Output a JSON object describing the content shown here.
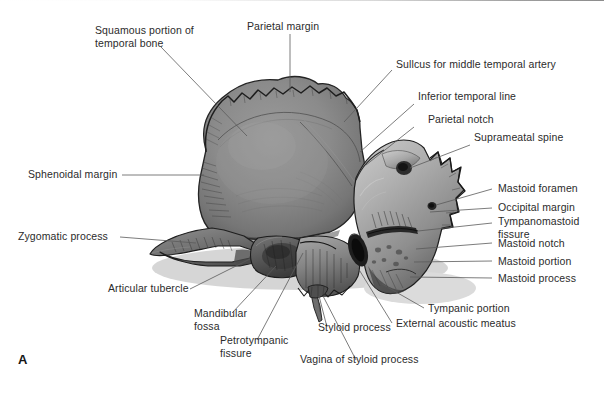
{
  "figure": {
    "panel_letter": "A",
    "background_color": "#ffffff",
    "leader_line_color": "#5a5a5a",
    "label_text_color": "#2b2b2b",
    "bone_tone_light": "#b8b8b8",
    "bone_tone_mid": "#8a8a8a",
    "bone_tone_dark": "#5c5c5c",
    "bone_outline": "#2a2a2a"
  },
  "labels": [
    {
      "id": "squamous-portion",
      "line1": "Squamous portion of",
      "line2": "temporal bone"
    },
    {
      "id": "parietal-margin",
      "line1": "Parietal margin",
      "line2": ""
    },
    {
      "id": "sulcus-middle-temporal-artery",
      "line1": "Sullcus for middle temporal artery",
      "line2": ""
    },
    {
      "id": "inferior-temporal-line",
      "line1": "Inferior temporal line",
      "line2": ""
    },
    {
      "id": "parietal-notch",
      "line1": "Parietal notch",
      "line2": ""
    },
    {
      "id": "suprameatal-spine",
      "line1": "Suprameatal spine",
      "line2": ""
    },
    {
      "id": "sphenoidal-margin",
      "line1": "Sphenoidal margin",
      "line2": ""
    },
    {
      "id": "zygomatic-process",
      "line1": "Zygomatic process",
      "line2": ""
    },
    {
      "id": "articular-tubercle",
      "line1": "Articular tubercle",
      "line2": ""
    },
    {
      "id": "mastoid-foramen",
      "line1": "Mastoid foramen",
      "line2": ""
    },
    {
      "id": "occipital-margin",
      "line1": "Occipital margin",
      "line2": ""
    },
    {
      "id": "tympanomastoid-fissure",
      "line1": "Tympanomastoid",
      "line2": "fissure"
    },
    {
      "id": "mastoid-notch",
      "line1": "Mastoid notch",
      "line2": ""
    },
    {
      "id": "mastoid-portion",
      "line1": "Mastoid portion",
      "line2": ""
    },
    {
      "id": "mastoid-process",
      "line1": "Mastoid process",
      "line2": ""
    },
    {
      "id": "tympanic-portion",
      "line1": "Tympanic portion",
      "line2": ""
    },
    {
      "id": "external-acoustic-meatus",
      "line1": "External acoustic meatus",
      "line2": ""
    },
    {
      "id": "mandibular-fossa",
      "line1": "Mandibular",
      "line2": "fossa"
    },
    {
      "id": "petrotympanic-fissure",
      "line1": "Petrotympanic",
      "line2": "fissure"
    },
    {
      "id": "styloid-process",
      "line1": "Styloid process",
      "line2": ""
    },
    {
      "id": "vagina-of-styloid-process",
      "line1": "Vagina of styloid process",
      "line2": ""
    }
  ]
}
